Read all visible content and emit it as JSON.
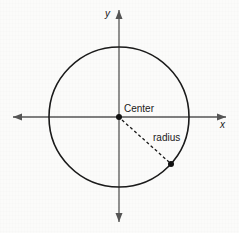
{
  "figure": {
    "background_color": "#fbfbfa",
    "stroke_color": "#1a1a1a",
    "axis_color": "#555555"
  },
  "axes": {
    "x_label": "x",
    "y_label": "y",
    "origin": {
      "x": 119,
      "y": 117
    },
    "x_axis": {
      "x1": 13,
      "y1": 117,
      "x2": 226,
      "y2": 117
    },
    "y_axis": {
      "x1": 119,
      "y1": 10,
      "x2": 119,
      "y2": 222
    },
    "arrowheads": [
      "left",
      "right",
      "up",
      "down"
    ]
  },
  "circle": {
    "cx": 119,
    "cy": 117,
    "r": 70,
    "stroke_width": 1.6,
    "fill": "none"
  },
  "labels": {
    "center": "Center",
    "radius": "radius"
  },
  "points": {
    "center_dot": {
      "cx": 119,
      "cy": 117,
      "r": 3
    },
    "radius_end_dot": {
      "cx": 171,
      "cy": 164,
      "r": 3
    }
  },
  "radius_line": {
    "x1": 122,
    "y1": 120,
    "x2": 169,
    "y2": 162,
    "dash": "3,2.5",
    "style": "dashed"
  }
}
